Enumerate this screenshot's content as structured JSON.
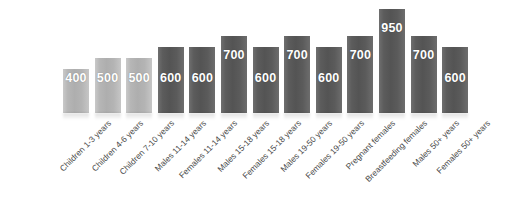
{
  "chart_data": {
    "type": "bar",
    "title": "",
    "subtitle": "",
    "xlabel": "",
    "ylabel": "",
    "ylim": [
      0,
      1000
    ],
    "grid": false,
    "legend": "none",
    "categories": [
      "Children 1-3 years",
      "Children 4-6 years",
      "Children 7-10 years",
      "Males 11-14 years",
      "Females 11-14 years",
      "Males 15-18 years",
      "Females 15-18 years",
      "Males 19-50 years",
      "Females 19-50 years",
      "Pregnant females",
      "Breastfeeding females",
      "Males 50+ years",
      "Females 50+ years"
    ],
    "values": [
      400,
      500,
      500,
      600,
      600,
      700,
      600,
      700,
      600,
      700,
      950,
      700,
      600
    ],
    "value_labels": [
      "400",
      "500",
      "500",
      "600",
      "600",
      "700",
      "600",
      "700",
      "600",
      "700",
      "950",
      "700",
      "600"
    ],
    "bar_styles": [
      "light",
      "light",
      "light",
      "dark",
      "dark",
      "dark",
      "dark",
      "dark",
      "dark",
      "dark",
      "dark",
      "dark",
      "dark"
    ],
    "colors": {
      "light_bar": "#b4b4b4",
      "dark_bar": "#5a5a5a",
      "value_label": "#ffffff",
      "category_label": "#4a4a4a",
      "background": "#ffffff"
    }
  }
}
